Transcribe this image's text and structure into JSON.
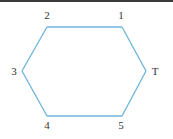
{
  "diagram": {
    "type": "hexagon-graph",
    "edge_color": "#6fb3d9",
    "label_color": "#333333",
    "nodes": [
      {
        "id": "1",
        "label": "1",
        "x": 122,
        "y": 27,
        "lx": 121,
        "ly": 19
      },
      {
        "id": "2",
        "label": "2",
        "x": 47,
        "y": 27,
        "lx": 47,
        "ly": 19
      },
      {
        "id": "3",
        "label": "3",
        "x": 22,
        "y": 71,
        "lx": 14,
        "ly": 75
      },
      {
        "id": "4",
        "label": "4",
        "x": 47,
        "y": 116,
        "lx": 47,
        "ly": 129
      },
      {
        "id": "5",
        "label": "5",
        "x": 122,
        "y": 116,
        "lx": 121,
        "ly": 129
      },
      {
        "id": "T",
        "label": "T",
        "x": 146,
        "y": 71,
        "lx": 155,
        "ly": 75
      }
    ],
    "edges": [
      [
        "2",
        "1"
      ],
      [
        "1",
        "T"
      ],
      [
        "T",
        "5"
      ],
      [
        "5",
        "4"
      ],
      [
        "4",
        "3"
      ],
      [
        "3",
        "2"
      ]
    ]
  }
}
